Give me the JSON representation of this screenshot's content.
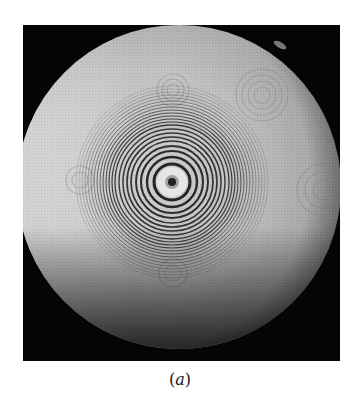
{
  "figure": {
    "caption_open": "(",
    "caption_letter": "a",
    "caption_close": ")",
    "colors": {
      "background": "#050505",
      "disk_light": "#d8d8d8",
      "disk_mid": "#a8a8a8",
      "ring_dark": "#1a1a1a"
    },
    "ring_center": {
      "x": 149,
      "y": 157
    },
    "central_ring_radii": [
      18,
      25,
      31,
      36,
      41,
      45,
      49,
      53,
      57,
      60,
      63,
      66,
      69,
      72,
      75,
      78,
      81,
      84,
      87,
      90
    ]
  }
}
